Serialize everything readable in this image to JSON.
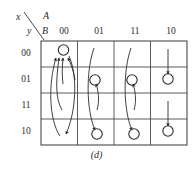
{
  "figure": {
    "caption": "(d)",
    "colors": {
      "ink": "#2b2b2b",
      "grid": "#4a4a4a",
      "background": "#ffffff"
    },
    "axis": {
      "top_left_variable": "x",
      "bottom_left_variable": "y",
      "column_group_label": "A",
      "row_group_label": "B"
    },
    "column_headers": [
      "00",
      "01",
      "11",
      "10"
    ],
    "row_headers": [
      "00",
      "01",
      "11",
      "10"
    ],
    "grid": {
      "columns": 4,
      "rows": 4,
      "left": 41,
      "top": 41,
      "cell_width": 36.5,
      "cell_height": 26
    },
    "circles": [
      {
        "name": "state-col0-row0",
        "col": 0,
        "row": 0
      },
      {
        "name": "state-col1-row1",
        "col": 1,
        "row": 1
      },
      {
        "name": "state-col1-row3",
        "col": 1,
        "row": 3
      },
      {
        "name": "state-col2-row1",
        "col": 2,
        "row": 1
      },
      {
        "name": "state-col2-row3",
        "col": 2,
        "row": 3
      },
      {
        "name": "state-col3-row1",
        "col": 3,
        "row": 1
      },
      {
        "name": "state-col3-row3",
        "col": 3,
        "row": 3
      }
    ],
    "transitions": [
      {
        "name": "arrow-col0-r1-to-r0",
        "from_col": 0,
        "from_row": 1,
        "to_col": 0,
        "to_row": 0
      },
      {
        "name": "arrow-col0-r2-to-r0",
        "from_col": 0,
        "from_row": 2,
        "to_col": 0,
        "to_row": 0
      },
      {
        "name": "arrow-col0-r3-to-r0",
        "from_col": 0,
        "from_row": 3,
        "to_col": 0,
        "to_row": 0
      },
      {
        "name": "arrow-col0-r0-to-r3",
        "from_col": 0,
        "from_row": 0,
        "to_col": 0,
        "to_row": 3
      },
      {
        "name": "arrow-col1-r0-to-r3",
        "from_col": 1,
        "from_row": 0,
        "to_col": 1,
        "to_row": 3
      },
      {
        "name": "arrow-col1-r2-to-r1",
        "from_col": 1,
        "from_row": 2,
        "to_col": 1,
        "to_row": 1
      },
      {
        "name": "arrow-col2-r0-to-r3",
        "from_col": 2,
        "from_row": 0,
        "to_col": 2,
        "to_row": 3
      },
      {
        "name": "arrow-col2-r2-to-r1",
        "from_col": 2,
        "from_row": 2,
        "to_col": 2,
        "to_row": 1
      },
      {
        "name": "arrow-col3-r0-to-r1",
        "from_col": 3,
        "from_row": 0,
        "to_col": 3,
        "to_row": 1
      },
      {
        "name": "arrow-col3-r2-to-r3",
        "from_col": 3,
        "from_row": 2,
        "to_col": 3,
        "to_row": 3
      }
    ]
  }
}
